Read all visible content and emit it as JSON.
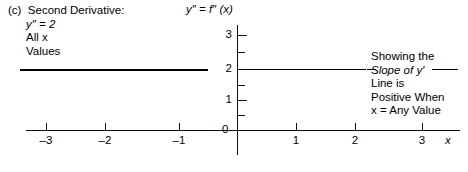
{
  "figure": {
    "part_label": "(c)",
    "caption": {
      "heading": "Second Derivative:",
      "equation": "y″ = 2",
      "domain_line1": "All x",
      "domain_line2": "Values"
    },
    "title": "y″ = f″ (x)",
    "annotation": {
      "line1": "Showing the",
      "line2": "Slope of y′",
      "line3": "Line is",
      "line4": "Positive When",
      "line5": "x = Any Value"
    },
    "axis_name_x": "x",
    "origin_label": "0",
    "line_color": "#000000"
  },
  "chart_data": {
    "type": "line",
    "title": "y″ = f″ (x)",
    "xlabel": "x",
    "ylabel": "",
    "xlim": [
      -3.6,
      3.8
    ],
    "ylim": [
      -0.8,
      3.3
    ],
    "grid": false,
    "legend": null,
    "x_ticks": [
      -3,
      -2,
      -1,
      0,
      1,
      2,
      3
    ],
    "x_tick_labels": [
      "-3",
      "-2",
      "-1",
      "0",
      "1",
      "2",
      "3"
    ],
    "y_ticks": [
      0,
      0.5,
      1,
      1.5,
      2,
      2.5,
      3
    ],
    "y_tick_labels": [
      "0",
      "",
      "1",
      "",
      "2",
      "",
      "3"
    ],
    "series": [
      {
        "name": "y″ = 2",
        "x": [
          -3.7,
          3.75
        ],
        "values": [
          2,
          2
        ],
        "description": "Horizontal constant line at y = 2 spanning all x values"
      }
    ],
    "annotations": [
      "(c) Second Derivative:",
      "y″ = 2",
      "All x Values",
      "Showing the Slope of y′ Line is Positive When x = Any Value"
    ]
  },
  "ticks": {
    "x": [
      {
        "label": "-3",
        "px": 46
      },
      {
        "label": "-2",
        "px": 105
      },
      {
        "label": "-1",
        "px": 179
      },
      {
        "label": "1",
        "px": 296
      },
      {
        "label": "2",
        "px": 355
      },
      {
        "label": "3",
        "px": 422
      }
    ],
    "y_major": [
      {
        "label": "3",
        "px": 35
      },
      {
        "label": "2",
        "px": 69
      },
      {
        "label": "1",
        "px": 100
      },
      {
        "label": "0",
        "px": 130
      }
    ],
    "y_minor": [
      {
        "px": 52
      },
      {
        "px": 85
      },
      {
        "px": 115
      }
    ]
  }
}
